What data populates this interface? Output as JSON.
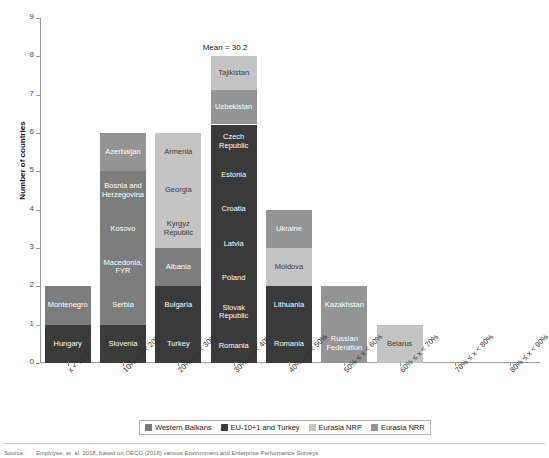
{
  "axes": {
    "y_title": "Number of countries",
    "y_ticks": [
      "0",
      "1",
      "2",
      "3",
      "4",
      "5",
      "6",
      "7",
      "8",
      "9"
    ],
    "x_ticks": [
      "x < 10%",
      "10% ≤ x < 20%",
      "20% ≤ x < 30%",
      "30% ≤ x < 40%",
      "40% ≤ x < 50%",
      "50% ≤ x < 60%",
      "60% ≤ x < 70%",
      "70% ≤ x < 80%",
      "80% ≤ x < 90%"
    ]
  },
  "annotation": {
    "mean_label": "Mean = 30.2"
  },
  "legend": {
    "items": [
      {
        "label": "Western Balkans",
        "color": "#7d7d7d"
      },
      {
        "label": "EU-10+1 and Turkey",
        "color": "#3a3a3a"
      },
      {
        "label": "Eurasia NRP",
        "color": "#c4c4c4"
      },
      {
        "label": "Eurasia NRR",
        "color": "#949494"
      }
    ]
  },
  "caption": {
    "key": "Source:",
    "text": "Employee, et. al. 2018, based on OECD (2018) various Environment and Enterprise Performance Surveys."
  },
  "chart_data": {
    "type": "bar",
    "subtype": "stacked",
    "title": "",
    "xlabel": "",
    "ylabel": "Number of countries",
    "ylim": [
      0,
      9
    ],
    "grid": false,
    "legend_position": "bottom",
    "mean": 30.2,
    "group_colors": {
      "Western Balkans": "#7d7d7d",
      "EU-10+1 and Turkey": "#3a3a3a",
      "Eurasia NRP": "#c4c4c4",
      "Eurasia NRR": "#949494"
    },
    "categories": [
      "x < 10%",
      "10% ≤ x < 20%",
      "20% ≤ x < 30%",
      "30% ≤ x < 40%",
      "40% ≤ x < 50%",
      "50% ≤ x < 60%",
      "60% ≤ x < 70%",
      "70% ≤ x < 80%",
      "80% ≤ x < 90%"
    ],
    "values": [
      2,
      6,
      6,
      8,
      4,
      2,
      1,
      0,
      0
    ],
    "bars": [
      {
        "category": "x < 10%",
        "total": 2,
        "segments": [
          {
            "label": "Hungary",
            "value": 1,
            "group": "EU-10+1 and Turkey"
          },
          {
            "label": "Montenegro",
            "value": 1,
            "group": "Western Balkans"
          }
        ]
      },
      {
        "category": "10% ≤ x < 20%",
        "total": 6,
        "segments": [
          {
            "label": "Slovenia",
            "value": 1,
            "group": "EU-10+1 and Turkey"
          },
          {
            "label": "Serbia",
            "value": 1,
            "group": "Western Balkans"
          },
          {
            "label": "Macedonia, FYR",
            "value": 1,
            "group": "Western Balkans"
          },
          {
            "label": "Kosovo",
            "value": 1,
            "group": "Western Balkans"
          },
          {
            "label": "Bosnia and Herzegovina",
            "value": 1,
            "group": "Western Balkans"
          },
          {
            "label": "Azerbaijan",
            "value": 1,
            "group": "Eurasia NRR"
          }
        ]
      },
      {
        "category": "20% ≤ x < 30%",
        "total": 6,
        "segments": [
          {
            "label": "Turkey",
            "value": 1,
            "group": "EU-10+1 and Turkey"
          },
          {
            "label": "Bulgaria",
            "value": 1,
            "group": "EU-10+1 and Turkey"
          },
          {
            "label": "Albania",
            "value": 1,
            "group": "Western Balkans"
          },
          {
            "label": "Kyrgyz Republic",
            "value": 1,
            "group": "Eurasia NRP"
          },
          {
            "label": "Georgia",
            "value": 1,
            "group": "Eurasia NRP"
          },
          {
            "label": "Armenia",
            "value": 1,
            "group": "Eurasia NRP"
          }
        ]
      },
      {
        "category": "30% ≤ x < 40%",
        "total": 8,
        "segments": [
          {
            "label": "Romania",
            "value": 1,
            "group": "EU-10+1 and Turkey"
          },
          {
            "label": "Slovak Republic",
            "value": 1,
            "group": "EU-10+1 and Turkey"
          },
          {
            "label": "Poland",
            "value": 1,
            "group": "EU-10+1 and Turkey"
          },
          {
            "label": "Latvia",
            "value": 1,
            "group": "EU-10+1 and Turkey"
          },
          {
            "label": "Croatia",
            "value": 1,
            "group": "EU-10+1 and Turkey"
          },
          {
            "label": "Estonia",
            "value": 1,
            "group": "EU-10+1 and Turkey"
          },
          {
            "label": "Czech Republic",
            "value": 1,
            "group": "EU-10+1 and Turkey"
          },
          {
            "label": "Uzbekistan",
            "value": 1,
            "group": "Eurasia NRR"
          },
          {
            "label": "Tajikistan",
            "value": 1,
            "group": "Eurasia NRP"
          }
        ]
      },
      {
        "category": "40% ≤ x < 50%",
        "total": 4,
        "segments": [
          {
            "label": "Romania",
            "value": 1,
            "group": "EU-10+1 and Turkey"
          },
          {
            "label": "Lithuania",
            "value": 1,
            "group": "EU-10+1 and Turkey"
          },
          {
            "label": "Moldova",
            "value": 1,
            "group": "Eurasia NRP"
          },
          {
            "label": "Ukraine",
            "value": 1,
            "group": "Eurasia NRR"
          }
        ]
      },
      {
        "category": "50% ≤ x < 60%",
        "total": 2,
        "segments": [
          {
            "label": "Russian Federation",
            "value": 1,
            "group": "Eurasia NRR"
          },
          {
            "label": "Kazakhstan",
            "value": 1,
            "group": "Eurasia NRR"
          }
        ]
      },
      {
        "category": "60% ≤ x < 70%",
        "total": 1,
        "segments": [
          {
            "label": "Belarus",
            "value": 1,
            "group": "Eurasia NRP"
          }
        ]
      },
      {
        "category": "70% ≤ x < 80%",
        "total": 0,
        "segments": []
      },
      {
        "category": "80% ≤ x < 90%",
        "total": 0,
        "segments": []
      }
    ]
  }
}
